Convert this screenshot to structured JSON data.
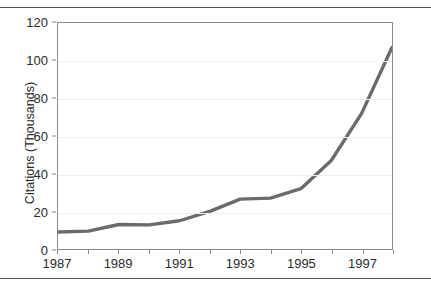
{
  "chart_data": {
    "type": "line",
    "title": "",
    "subtitle": "",
    "xlabel": "",
    "ylabel": "Citations (Thousands)",
    "x": [
      1987,
      1988,
      1989,
      1990,
      1991,
      1992,
      1993,
      1994,
      1995,
      1996,
      1997,
      1998
    ],
    "values": [
      9,
      9.5,
      13,
      12.8,
      15,
      20,
      26.5,
      27,
      32,
      47,
      72,
      107
    ],
    "series": [
      {
        "name": "Citations",
        "values": [
          9,
          9.5,
          13,
          12.8,
          15,
          20,
          26.5,
          27,
          32,
          47,
          72,
          107
        ]
      }
    ],
    "xlim": [
      1987,
      1998
    ],
    "ylim": [
      0,
      120
    ],
    "y_ticks": [
      0,
      20,
      40,
      60,
      80,
      100,
      120
    ],
    "y_tick_labels": [
      "0",
      "20",
      "40",
      "60",
      "80",
      "100",
      "120"
    ],
    "x_ticks": [
      1987,
      1988,
      1989,
      1990,
      1991,
      1992,
      1993,
      1994,
      1995,
      1996,
      1997,
      1998
    ],
    "x_tick_labels": [
      "1987",
      "",
      "1989",
      "",
      "1991",
      "",
      "1993",
      "",
      "1995",
      "",
      "1997",
      ""
    ],
    "x_labeled_ticks": [
      {
        "value": 1987,
        "label": "1987"
      },
      {
        "value": 1989,
        "label": "1989"
      },
      {
        "value": 1991,
        "label": "1991"
      },
      {
        "value": 1993,
        "label": "1993"
      },
      {
        "value": 1995,
        "label": "1995"
      },
      {
        "value": 1997,
        "label": "1997"
      }
    ],
    "grid": true,
    "grid_axis": "y",
    "legend": false,
    "legend_position": "none",
    "colors": {
      "line": "#6b6b6b",
      "grid": "#ededed",
      "axis": "#8a8a8a",
      "text": "#2b2b2b",
      "rule": "#555555",
      "background": "#ffffff"
    },
    "line_width": 3.4
  },
  "page": {
    "rule_top_label": "top-divider",
    "rule_bottom_label": "bottom-divider"
  }
}
